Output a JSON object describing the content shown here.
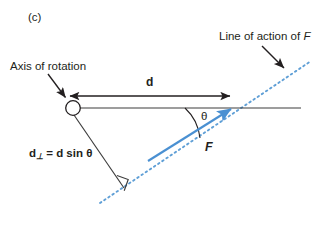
{
  "figure": {
    "panel_label": "(c)",
    "background_color": "#ffffff",
    "line_color": "#231f20",
    "accent_color": "#4a90d2",
    "text_color": "#231f20"
  },
  "labels": {
    "axis_of_rotation": "Axis of rotation",
    "line_of_action_prefix": "Line of action of ",
    "line_of_action_symbol": "F",
    "distance_d": "d",
    "force_symbol": "F",
    "theta_symbol": "θ",
    "perp_distance_lead": "d",
    "perp_distance_sub": "⊥",
    "perp_distance_rest": " = d sin θ"
  },
  "geometry": {
    "pivot_circle": {
      "cx": 73,
      "cy": 108,
      "r": 7.5
    },
    "lever_arm_line": {
      "x1": 80,
      "y1": 108,
      "x2": 301,
      "y2": 108
    },
    "dimension_arrow_d": {
      "x1": 68,
      "y1": 96,
      "x2": 232,
      "y2": 96
    },
    "force_vector_F": {
      "x1": 150,
      "y1": 160,
      "x2": 233,
      "y2": 108
    },
    "line_of_action_dashed": {
      "x1": 100,
      "y1": 203,
      "x2": 311,
      "y2": 61
    },
    "perpendicular_segment": {
      "x1": 74,
      "y1": 114,
      "x2": 124,
      "y2": 187
    },
    "right_angle_marker": {
      "x": 124,
      "y": 187,
      "size": 10
    },
    "pointer_to_axis": {
      "x1": 48,
      "y1": 74,
      "x2": 67,
      "y2": 99
    },
    "pointer_to_line_of_action": {
      "x1": 262,
      "y1": 46,
      "x2": 286,
      "y2": 70
    },
    "theta_arc": {
      "cx": 233,
      "cy": 108,
      "radius": 52
    }
  }
}
